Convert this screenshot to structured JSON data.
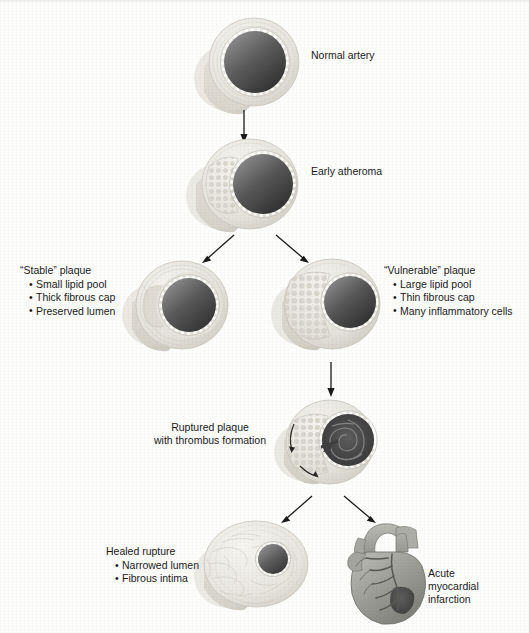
{
  "diagram": {
    "background_color": "#fdfdfc",
    "stages": [
      {
        "id": "normal-artery",
        "label": "Normal artery",
        "bullets": []
      },
      {
        "id": "early-atheroma",
        "label": "Early atheroma",
        "bullets": []
      },
      {
        "id": "stable-plaque",
        "label": "“Stable” plaque",
        "bullets": [
          "Small lipid pool",
          "Thick fibrous cap",
          "Preserved lumen"
        ]
      },
      {
        "id": "vulnerable-plaque",
        "label": "“Vulnerable” plaque",
        "bullets": [
          "Large lipid pool",
          "Thin fibrous cap",
          "Many inflammatory cells"
        ]
      },
      {
        "id": "ruptured-plaque",
        "label_line1": "Ruptured plaque",
        "label_line2": "with thrombus formation",
        "bullets": []
      },
      {
        "id": "healed-rupture",
        "label": "Healed rupture",
        "bullets": [
          "Narrowed lumen",
          "Fibrous intima"
        ]
      },
      {
        "id": "acute-myocardial-infarction",
        "label_line1": "Acute",
        "label_line2": "myocardial",
        "label_line3": "infarction",
        "bullets": []
      }
    ],
    "colors": {
      "vessel_wall": "#e9e7e2",
      "vessel_wall_shadow": "#cfccc4",
      "lumen_dark": "#3c3c3c",
      "lumen_light": "#8d8d8d",
      "endothelium": "#ffffff",
      "lipid_pool": "#dedbd4",
      "thrombus": "#4a4a4a",
      "heart_muscle": "#9a9a95",
      "infarct": "#4f4f4f",
      "arrow": "#1a1a1a",
      "text": "#1b1b1b"
    }
  }
}
